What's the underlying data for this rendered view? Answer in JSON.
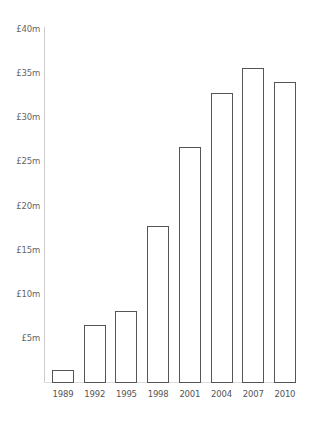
{
  "chart_data": {
    "type": "bar",
    "title": "",
    "xlabel": "",
    "ylabel": "",
    "categories": [
      "1989",
      "1992",
      "1995",
      "1998",
      "2001",
      "2004",
      "2007",
      "2010"
    ],
    "values": [
      1.4,
      6.5,
      8.0,
      17.7,
      26.6,
      32.7,
      35.6,
      34.0
    ],
    "unit": "£m",
    "ylim": [
      0,
      40
    ],
    "yticks": [
      5,
      10,
      15,
      20,
      25,
      30,
      35,
      40
    ],
    "ytick_labels": [
      "£5m",
      "£10m",
      "£15m",
      "£20m",
      "£25m",
      "£30m",
      "£35m",
      "£40m"
    ],
    "grid": false,
    "legend": null,
    "bar_style": {
      "fill": "#ffffff",
      "stroke": "#555555"
    }
  }
}
